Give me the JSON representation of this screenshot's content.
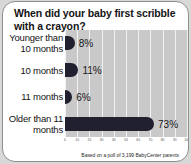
{
  "card": {
    "title": "When did your baby first scribble with a crayon?",
    "footer": "Based on a poll of 3,199 BabyCenter parents"
  },
  "colors": {
    "bar": "#20202e",
    "plot_background": "#c9c9c9",
    "gridline": "#f2f2f2",
    "card_background": "#ffffff",
    "page_background": "#d8d8d8",
    "text": "#141414"
  },
  "chart_data": {
    "type": "bar",
    "orientation": "horizontal",
    "title": "When did your baby first scribble with a crayon?",
    "xlabel": "",
    "ylabel": "",
    "categories": [
      "Younger than 10 months",
      "10 months",
      "11 months",
      "Older than 11 months"
    ],
    "values": [
      8,
      11,
      6,
      73
    ],
    "value_labels": [
      "8%",
      "11%",
      "6%",
      "73%"
    ],
    "xlim": [
      0,
      100
    ],
    "xticks": [
      0,
      10,
      20,
      30,
      40,
      50,
      60,
      70,
      80,
      90,
      100
    ],
    "xticklabels": [
      "0",
      "10",
      "20",
      "30",
      "40",
      "50",
      "60",
      "70",
      "80",
      "90",
      "100"
    ],
    "grid": true,
    "grid_axis": "x",
    "legend": false,
    "annotation": "Based on a poll of 3,199 BabyCenter parents"
  }
}
